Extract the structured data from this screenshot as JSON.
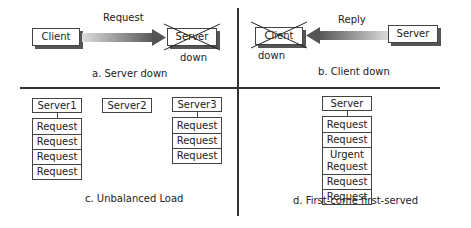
{
  "panel_a": {
    "client": "Client",
    "server": "Server",
    "arrow_label": "Request",
    "status": "down",
    "caption": "a. Server down"
  },
  "panel_b": {
    "client": "Client",
    "server": "Server",
    "arrow_label": "Reply",
    "status": "down",
    "caption": "b. Client down"
  },
  "panel_c": {
    "servers": [
      {
        "name": "Server1",
        "requests": [
          "Request",
          "Request",
          "Request",
          "Request"
        ]
      },
      {
        "name": "Server2",
        "requests": []
      },
      {
        "name": "Server3",
        "requests": [
          "Request",
          "Request",
          "Request"
        ]
      }
    ],
    "caption": "c. Unbalanced Load"
  },
  "panel_d": {
    "server": "Server",
    "requests": [
      "Request",
      "Request",
      "Urgent Request",
      "Request",
      "Request"
    ],
    "caption": "d. First-come first-served"
  },
  "colors": {
    "line": "#333333",
    "arrow_dark": "#555555",
    "arrow_light": "#dddddd"
  }
}
